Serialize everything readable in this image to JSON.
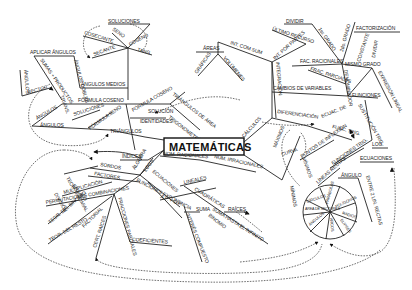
{
  "title": "MATEMÁTICAS",
  "colors": {
    "ink": "#222222",
    "background": "#ffffff"
  },
  "branches": {
    "trigonometria": {
      "label": "TRIGONOMETRÍA",
      "nodes": {
        "soluciones_top": "SOLUCIONES",
        "seno": "SENO",
        "cosecante": "COSECANTE",
        "coseno": "COSENO",
        "secante": "SECANTE",
        "tang": "TANG",
        "aplicar_angulos": "APLICAR ÁNGULOS",
        "sumas_productos": "SUMAS + PRODUCTOS",
        "angulos_dobles": "ÁNGULOS DOBLES",
        "angulos_medios": "ÁNGULOS MEDIOS",
        "angulos_rectos_a": "ÁNGULOS",
        "rectos": "RECTOS",
        "trians": "TRIANS.",
        "formula_coseno": "FÓRMULA COSENO",
        "formula_coseno_2": "FÓRMULA COSENO",
        "triangulos_de_area": "TRIÁNGULOS DE ÁREA",
        "solucion": "SOLUCIÓN",
        "identidades": "IDENTIDADES",
        "angulos_left": "ÁNGULOS",
        "soluciones_mid": "SOLUCIONES",
        "formula_seno": "FÓRMULA SENO",
        "angulos_low": "ÁNGULOS",
        "triangulos": "TRIÁNGULOS"
      }
    },
    "areas": {
      "areas": "ÁREAS",
      "graficas": "GRÁFICAS",
      "volumenes": "VOLÚMENES",
      "int_com_sum": "INT. COM SUM"
    },
    "calculos": {
      "label": "CÁLCULOS",
      "nodes": {
        "integracion": "INTEGRACIÓN",
        "dividir": "DIVIDIR",
        "ultimo_recurso": "ÚLTIMO RECURSO",
        "int_por_partes": "INT. POR PARTES",
        "primer_grado": "1er. GRADO",
        "segundo_grado": "2do. GRADO",
        "factorizacion": "FACTORIZACIÓN",
        "fac_racionales": "FAC. RACIONALES",
        "frac_parciales": "FRAC. PARCIALES",
        "mismo_grado": "MISMO GRADO",
        "constante": "CONSTANTE",
        "dividir_2": "DIVIDIR",
        "denominador": "DENOMINADOR",
        "expresion_lineal": "EXPRESIÓN LINEAL",
        "cambios_de_variables": "CAMBIOS DE VARIABLES",
        "funciones": "FUNCIONES",
        "sustitucion_trig": "SUSTITUCIÓN TRIG.",
        "diferenciacion": "DIFERENCIACIÓN",
        "ecuac_de": "ECUAC. DE",
        "func_trig": "FUNC. TRIG.",
        "maximos": "MÁXIMOS",
        "curva": "CURVA",
        "minimos": "MÍNIMOS",
        "puntos_de_inflexion": "PUNTOS DE INFLEXIÓN",
        "funciones_trig": "FUNCIONES TRIG.",
        "lineas_rectas": "LÍNEAS RECTAS",
        "log": "LOG.",
        "ecuaciones": "ECUACIONES",
        "angulo": "ÁNGULO",
        "entre_2_lin_rectas": "ENTRE 2 LIN. RECTAS"
      }
    },
    "geometria_circle": {
      "segments": [
        "CÍRCULOS",
        "PARÁBOLAS",
        "POLÍGONOS",
        "RADIOS",
        "ÁREA DE SECTORES",
        "ELIPSES",
        "ARCOS",
        "ÁNGULOS",
        "ÁREA"
      ]
    },
    "algebra": {
      "label": "ÁLGEBRA",
      "nodes": {
        "indices": "ÍNDICES",
        "logs": "LOGS",
        "nom_racionales": "NOM. RACIONALES",
        "num_irracionales": "NÚM. IRRACIONALES",
        "ecuaciones": "ECUACIONES",
        "lineales": "LINEALES",
        "ap_gp": "A.P. + G.P.",
        "funciones_exponencia": "FUNCIONES EXPONENCIA",
        "cuadraticas": "CUADRÁTICAS",
        "suma": "SUMA",
        "suma_hasta_el_infinito": "SUMA HASTA EL INFINITO",
        "binomio": "BINOMIO",
        "raices": "RAÍCES",
        "interes_compuesto": "INTERÉS COMPUESTO",
        "coeficientes": "COEFICIENTES",
        "teor_binomial": "TEOR. BINOMIAL",
        "ensayo": "ENSAYO",
        "division": "DIVISIÓN",
        "sordos": "SORDOS",
        "factores": "FACTORES",
        "multiplicacion": "MULTIPLICACIÓN",
        "permutaciones_combinaciones": "PERMUTACIONES COMBINACIONES",
        "teor_del_binomio": "TEOR. DEL BINOMIO",
        "teor_del_resto": "TEOR. DEL RESTO",
        "factorial": "FACTORIAL",
        "cert_raices": "CERT. RAÍCES",
        "fracciones_parciales": "FRACCIONES PARCIALES"
      }
    }
  }
}
